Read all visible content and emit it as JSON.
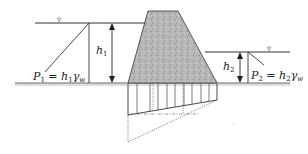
{
  "diagram": {
    "colors": {
      "line": "#333333",
      "dam_fill": "#b5b5b5",
      "ground_hatch": "#999999",
      "background": "#ffffff"
    },
    "water_symbol": "∇",
    "labels": {
      "h1_main": "h",
      "h1_sub": "1",
      "h2_main": "h",
      "h2_sub": "2",
      "p1_main": "P",
      "p1_sub": "1",
      "p1_eq": " = h",
      "p1_eq_sub": "1",
      "p1_gamma": "γ",
      "p1_gamma_sub": "w",
      "p2_main": "P",
      "p2_sub": "2",
      "p2_eq": " = h",
      "p2_eq_sub": "2",
      "p2_gamma": "γ",
      "p2_gamma_sub": "w"
    },
    "elements": [
      "upstream-water-surface",
      "downstream-water-surface",
      "gravity-dam-body",
      "ground-line",
      "h1-dimension-arrow",
      "h2-dimension-arrow",
      "upstream-pressure-triangle",
      "downstream-pressure-triangle",
      "uplift-pressure-diagram"
    ]
  }
}
